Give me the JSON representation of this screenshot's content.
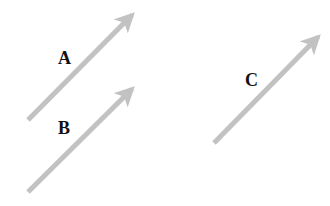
{
  "diagram": {
    "title": "",
    "arrow_color": "#c2c2c2",
    "label_color": "#111111",
    "arrows": [
      {
        "id": "A",
        "label": "A",
        "tail": [
          28,
          120
        ],
        "tip": [
          132,
          15
        ],
        "label_pos": [
          58,
          49
        ]
      },
      {
        "id": "B",
        "label": "B",
        "tail": [
          28,
          192
        ],
        "tip": [
          132,
          89
        ],
        "label_pos": [
          58,
          119
        ]
      },
      {
        "id": "C",
        "label": "C",
        "tail": [
          214,
          143
        ],
        "tip": [
          318,
          37
        ],
        "label_pos": [
          245,
          71
        ]
      }
    ]
  }
}
